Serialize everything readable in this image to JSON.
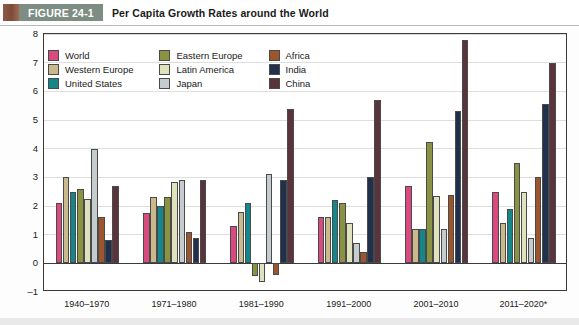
{
  "header": {
    "figure_number": "FIGURE 24-1",
    "title": "Per Capita Growth Rates around the World",
    "badge_color": "#7d8d84",
    "swatch_color": "#8d5a47"
  },
  "chart_data": {
    "type": "bar",
    "title": "Per Capita Growth Rates around the World",
    "xlabel": "",
    "ylabel": "",
    "ylim": [
      -1,
      8
    ],
    "yticks": [
      -1,
      0,
      1,
      2,
      3,
      4,
      5,
      6,
      7,
      8
    ],
    "ytick_labels": [
      "–1",
      "0",
      "1",
      "2",
      "3",
      "4",
      "5",
      "6",
      "7",
      "8"
    ],
    "grid": true,
    "legend_position": "top-left-inside",
    "categories": [
      "1940–1970",
      "1971–1980",
      "1981–1990",
      "1991–2000",
      "2001–2010",
      "2011–2020*"
    ],
    "series": [
      {
        "name": "World",
        "color": "#d94a7f",
        "values": [
          2.1,
          1.75,
          1.3,
          1.6,
          2.7,
          2.5
        ]
      },
      {
        "name": "Western Europe",
        "color": "#c9b98b",
        "values": [
          3.0,
          2.3,
          1.8,
          1.6,
          1.2,
          1.4
        ]
      },
      {
        "name": "United States",
        "color": "#15868a",
        "values": [
          2.5,
          2.0,
          2.1,
          2.2,
          1.2,
          1.9
        ]
      },
      {
        "name": "Eastern Europe",
        "color": "#8a9341",
        "values": [
          2.6,
          2.3,
          -0.45,
          2.1,
          4.25,
          3.5
        ]
      },
      {
        "name": "Latin America",
        "color": "#dfe2bc",
        "values": [
          2.25,
          2.85,
          -0.65,
          1.4,
          2.35,
          2.5
        ]
      },
      {
        "name": "Japan",
        "color": "#c6ccce",
        "values": [
          4.0,
          2.9,
          3.1,
          0.7,
          1.2,
          0.9
        ]
      },
      {
        "name": "Africa",
        "color": "#9c552c",
        "values": [
          1.6,
          1.1,
          -0.4,
          0.4,
          2.4,
          3.0
        ]
      },
      {
        "name": "India",
        "color": "#22314b",
        "values": [
          0.8,
          0.9,
          2.9,
          3.0,
          5.3,
          5.55
        ]
      },
      {
        "name": "China",
        "color": "#59343c",
        "values": [
          2.7,
          2.9,
          5.4,
          5.7,
          7.8,
          7.0
        ]
      }
    ]
  }
}
